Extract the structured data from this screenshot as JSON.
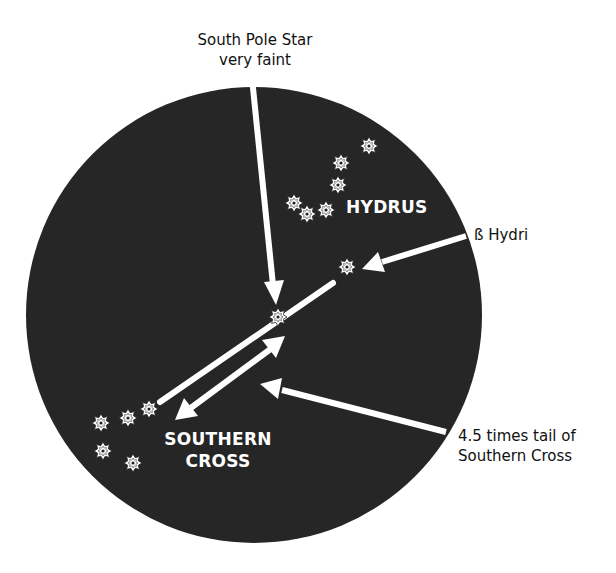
{
  "colors": {
    "sky": "#262626",
    "ink": "#ffffff",
    "text": "#111111",
    "background": "#ffffff"
  },
  "sky_circle": {
    "cx": 254,
    "cy": 315,
    "r": 228
  },
  "annotations": {
    "south_pole_star": {
      "line1": "South Pole Star",
      "line2": "very faint"
    },
    "beta_hydri": {
      "text": "ß Hydri"
    },
    "tail_multiple": {
      "line1": "4.5 times tail of",
      "line2": "Southern Cross"
    }
  },
  "constellations": {
    "hydrus": {
      "name": "HYDRUS",
      "stars": [
        [
          369,
          146
        ],
        [
          341,
          163
        ],
        [
          338,
          185
        ],
        [
          294,
          203
        ],
        [
          307,
          214
        ],
        [
          326,
          210
        ]
      ]
    },
    "southern_cross": {
      "name_line1": "SOUTHERN",
      "name_line2": "CROSS",
      "stars": [
        [
          101,
          423
        ],
        [
          128,
          418
        ],
        [
          149,
          409
        ],
        [
          103,
          451
        ],
        [
          133,
          463
        ]
      ]
    }
  },
  "named_stars": {
    "beta_hydri": [
      347,
      267
    ],
    "south_pole": [
      278,
      317
    ]
  },
  "icons": {
    "star": "eight-point-star-icon",
    "arrow": "arrow-icon"
  }
}
